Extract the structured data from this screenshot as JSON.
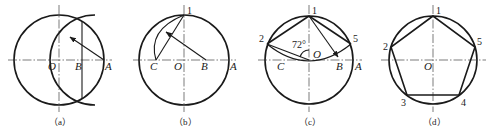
{
  "figure": {
    "panels": [
      {
        "id": "a",
        "caption": "（a）",
        "labels": {
          "O": "O",
          "B": "B",
          "A": "A"
        }
      },
      {
        "id": "b",
        "caption": "（b）",
        "labels": {
          "one": "1",
          "C": "C",
          "O": "O",
          "B": "B",
          "A": "A"
        }
      },
      {
        "id": "c",
        "caption": "（c）",
        "labels": {
          "one": "1",
          "two": "2",
          "five": "5",
          "angle": "72°",
          "O": "O",
          "C": "C",
          "B": "B",
          "A": "A"
        }
      },
      {
        "id": "d",
        "caption": "（d）",
        "labels": {
          "one": "1",
          "two": "2",
          "three": "3",
          "four": "4",
          "five": "5",
          "O": "O"
        }
      }
    ]
  }
}
